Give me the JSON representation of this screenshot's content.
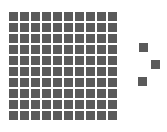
{
  "figure": {
    "grid": {
      "rows": 10,
      "cols": 10,
      "filled": 100,
      "color": "#5a5a5a"
    },
    "loose_squares": [
      {
        "x": 139,
        "y": 43
      },
      {
        "x": 151,
        "y": 60
      },
      {
        "x": 138,
        "y": 77
      }
    ],
    "total_squares": 103
  }
}
